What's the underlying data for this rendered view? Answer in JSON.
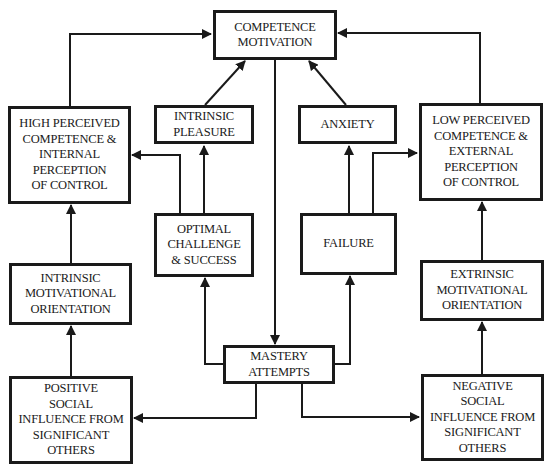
{
  "diagram": {
    "type": "flowchart",
    "nodes": {
      "competence_motivation": {
        "label": "COMPETENCE\nMOTIVATION"
      },
      "high_perceived": {
        "label": "HIGH PERCEIVED\nCOMPETENCE &\nINTERNAL\nPERCEPTION\nOF CONTROL"
      },
      "intrinsic_pleasure": {
        "label": "INTRINSIC\nPLEASURE"
      },
      "anxiety": {
        "label": "ANXIETY"
      },
      "low_perceived": {
        "label": "LOW PERCEIVED\nCOMPETENCE &\nEXTERNAL\nPERCEPTION\nOF CONTROL"
      },
      "optimal_challenge": {
        "label": "OPTIMAL\nCHALLENGE\n& SUCCESS"
      },
      "failure": {
        "label": "FAILURE"
      },
      "intrinsic_orientation": {
        "label": "INTRINSIC\nMOTIVATIONAL\nORIENTATION"
      },
      "extrinsic_orientation": {
        "label": "EXTRINSIC\nMOTIVATIONAL\nORIENTATION"
      },
      "mastery_attempts": {
        "label": "MASTERY\nATTEMPTS"
      },
      "positive_social": {
        "label": "POSITIVE\nSOCIAL\nINFLUENCE FROM\nSIGNIFICANT\nOTHERS"
      },
      "negative_social": {
        "label": "NEGATIVE\nSOCIAL\nINFLUENCE FROM\nSIGNIFICANT\nOTHERS"
      }
    },
    "edges": [
      {
        "from": "competence_motivation",
        "to": "mastery_attempts"
      },
      {
        "from": "mastery_attempts",
        "to": "optimal_challenge"
      },
      {
        "from": "mastery_attempts",
        "to": "failure"
      },
      {
        "from": "mastery_attempts",
        "to": "positive_social"
      },
      {
        "from": "mastery_attempts",
        "to": "negative_social"
      },
      {
        "from": "optimal_challenge",
        "to": "intrinsic_pleasure"
      },
      {
        "from": "optimal_challenge",
        "to": "high_perceived"
      },
      {
        "from": "failure",
        "to": "anxiety"
      },
      {
        "from": "failure",
        "to": "low_perceived"
      },
      {
        "from": "intrinsic_pleasure",
        "to": "competence_motivation"
      },
      {
        "from": "anxiety",
        "to": "competence_motivation"
      },
      {
        "from": "high_perceived",
        "to": "competence_motivation"
      },
      {
        "from": "low_perceived",
        "to": "competence_motivation"
      },
      {
        "from": "positive_social",
        "to": "intrinsic_orientation"
      },
      {
        "from": "intrinsic_orientation",
        "to": "high_perceived"
      },
      {
        "from": "negative_social",
        "to": "extrinsic_orientation"
      },
      {
        "from": "extrinsic_orientation",
        "to": "low_perceived"
      }
    ],
    "colors": {
      "stroke": "#1a1a1a",
      "background": "#ffffff"
    }
  }
}
